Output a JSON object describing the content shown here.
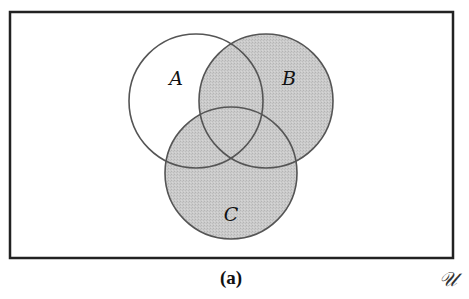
{
  "diagram": {
    "type": "venn",
    "caption": "(a)",
    "universe_label": "𝒰",
    "sets": [
      {
        "id": "A",
        "label": "A",
        "cx": 196,
        "cy": 101,
        "r": 67,
        "label_x": 176,
        "label_y": 80
      },
      {
        "id": "B",
        "label": "B",
        "cx": 266,
        "cy": 101,
        "r": 67,
        "label_x": 289,
        "label_y": 80
      },
      {
        "id": "C",
        "label": "C",
        "cx": 231,
        "cy": 173,
        "r": 66,
        "label_x": 231,
        "label_y": 216
      }
    ],
    "shaded_region": "B ∪ C",
    "colors": {
      "shade": "#c9c9c9",
      "stroke": "#555555",
      "border": "#222222",
      "background": "#ffffff"
    },
    "box": {
      "x": 10,
      "y": 12,
      "width": 443,
      "height": 246
    }
  }
}
